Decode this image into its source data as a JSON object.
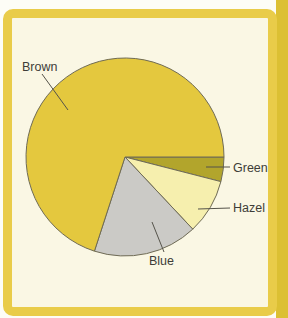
{
  "figure": {
    "background_color": "#faf7e4",
    "page_color": "#fdfdf6",
    "frame_color": "#e9cc49",
    "edge_strip_color": "#dcc033",
    "text_color": "#3e3d38"
  },
  "chart_data": {
    "type": "pie",
    "title": "",
    "start_angle_deg": 0,
    "direction": "clockwise",
    "values_unit": "percent (estimated from slice angles; no numbers printed)",
    "outline_color": "#6f6b55",
    "leader_line_color": "#55534a",
    "slices": [
      {
        "label": "Green",
        "value": 4,
        "color": "#b2a52c"
      },
      {
        "label": "Hazel",
        "value": 9,
        "color": "#f6efae"
      },
      {
        "label": "Blue",
        "value": 17,
        "color": "#cbcac6"
      },
      {
        "label": "Brown",
        "value": 70,
        "color": "#e4c83e"
      }
    ],
    "labels_shown": [
      "Brown",
      "Green",
      "Hazel",
      "Blue"
    ],
    "legend": "none"
  }
}
